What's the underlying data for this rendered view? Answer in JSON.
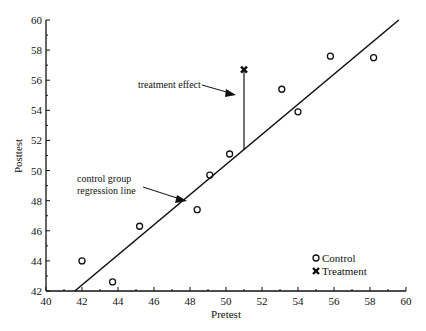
{
  "chart_data": {
    "type": "scatter",
    "title": "",
    "xlabel": "Pretest",
    "ylabel": "Posttest",
    "xlim": [
      40,
      60
    ],
    "ylim": [
      42,
      60
    ],
    "x_ticks": [
      40,
      42,
      44,
      46,
      48,
      50,
      52,
      54,
      56,
      58,
      60
    ],
    "y_ticks": [
      42,
      44,
      46,
      48,
      50,
      52,
      54,
      56,
      58,
      60
    ],
    "grid": false,
    "legend_position": "lower right",
    "series": [
      {
        "name": "Control",
        "marker": "open-circle",
        "points": [
          {
            "x": 42.0,
            "y": 44.0
          },
          {
            "x": 43.7,
            "y": 42.6
          },
          {
            "x": 45.2,
            "y": 46.3
          },
          {
            "x": 48.4,
            "y": 47.4
          },
          {
            "x": 49.1,
            "y": 49.7
          },
          {
            "x": 50.2,
            "y": 51.1
          },
          {
            "x": 53.1,
            "y": 55.4
          },
          {
            "x": 54.0,
            "y": 53.9
          },
          {
            "x": 55.8,
            "y": 57.6
          },
          {
            "x": 58.2,
            "y": 57.5
          }
        ]
      },
      {
        "name": "Treatment",
        "marker": "filled-x",
        "points": [
          {
            "x": 51.0,
            "y": 56.7
          }
        ]
      }
    ],
    "regression_line": {
      "label": "control group regression line",
      "from": {
        "x": 41.6,
        "y": 42.0
      },
      "to": {
        "x": 59.6,
        "y": 60.0
      }
    },
    "annotations": [
      {
        "id": "treatment-effect",
        "text": "treatment effect",
        "line_x": 51.0,
        "line_y_from": 56.6,
        "line_y_to": 51.4
      },
      {
        "id": "regression-label",
        "lines": [
          "control group",
          "regression line"
        ]
      }
    ],
    "legend": [
      "Control",
      "Treatment"
    ]
  }
}
